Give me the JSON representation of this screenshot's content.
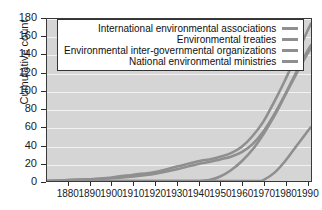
{
  "chart_data": {
    "type": "line",
    "title": "",
    "xlabel": "",
    "ylabel": "Cumulative count",
    "xlim": [
      1870,
      1992
    ],
    "ylim": [
      0,
      180
    ],
    "grid": "horizontal",
    "legend_position": "top-center",
    "series_color": "#8f8f8f",
    "plot_background": "#d5d5d5",
    "gridline_color": "#f2f2f2",
    "xticks": [
      1880,
      1890,
      1900,
      1910,
      1920,
      1930,
      1940,
      1950,
      1960,
      1970,
      1980,
      1990
    ],
    "yticks": [
      0,
      20,
      40,
      60,
      80,
      100,
      120,
      140,
      160,
      180
    ],
    "series": [
      {
        "name": "International environmental associations",
        "x": [
          1870,
          1880,
          1890,
          1900,
          1910,
          1920,
          1930,
          1940,
          1945,
          1950,
          1955,
          1960,
          1965,
          1970,
          1975,
          1980,
          1985,
          1990,
          1992
        ],
        "values": [
          0,
          1,
          2,
          4,
          7,
          10,
          16,
          22,
          24,
          27,
          31,
          38,
          50,
          66,
          88,
          112,
          138,
          165,
          175
        ]
      },
      {
        "name": "Environmental treaties",
        "x": [
          1870,
          1880,
          1890,
          1900,
          1910,
          1920,
          1930,
          1940,
          1945,
          1950,
          1955,
          1960,
          1965,
          1970,
          1975,
          1980,
          1985,
          1990,
          1992
        ],
        "values": [
          0,
          1,
          2,
          3,
          5,
          8,
          13,
          19,
          21,
          24,
          27,
          32,
          41,
          55,
          74,
          96,
          120,
          143,
          151
        ]
      },
      {
        "name": "Environmental inter-governmental organizations",
        "x": [
          1870,
          1880,
          1890,
          1900,
          1910,
          1920,
          1930,
          1940,
          1945,
          1950,
          1955,
          1960,
          1965,
          1970,
          1975,
          1980,
          1985,
          1990,
          1992
        ],
        "values": [
          0,
          0,
          0,
          0,
          0,
          0,
          0,
          0,
          1,
          5,
          12,
          22,
          35,
          52,
          72,
          95,
          118,
          140,
          147
        ]
      },
      {
        "name": "National environmental ministries",
        "x": [
          1870,
          1940,
          1950,
          1960,
          1968,
          1970,
          1975,
          1980,
          1985,
          1990,
          1992
        ],
        "values": [
          0,
          0,
          0,
          0,
          0,
          1,
          9,
          22,
          38,
          54,
          60
        ]
      }
    ]
  },
  "axes": {
    "ylabel": "Cumulative count",
    "ytick_labels": [
      "180",
      "160",
      "140",
      "120",
      "100",
      "80",
      "60",
      "40",
      "20",
      "0"
    ],
    "xtick_labels": [
      "1880",
      "1890",
      "1900",
      "1910",
      "1920",
      "1930",
      "1940",
      "1950",
      "1960",
      "1970",
      "1980",
      "1990"
    ]
  },
  "legend": {
    "entries": [
      {
        "label": "International environmental associations"
      },
      {
        "label": "Environmental treaties"
      },
      {
        "label": "Environmental inter-governmental organizations"
      },
      {
        "label": "National environmental ministries"
      }
    ]
  }
}
